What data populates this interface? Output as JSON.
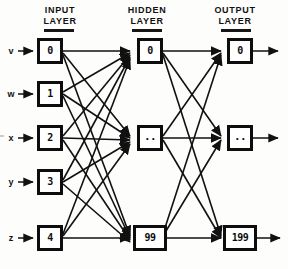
{
  "diagram": {
    "type": "neural-network",
    "columns": [
      {
        "id": "input",
        "heading_line1": "INPUT",
        "heading_line2": "LAYER"
      },
      {
        "id": "hidden",
        "heading_line1": "HIDDEN",
        "heading_line2": "LAYER"
      },
      {
        "id": "output",
        "heading_line1": "OUTPUT",
        "heading_line2": "LAYER"
      }
    ],
    "input_layer": {
      "variables": [
        "v",
        "w",
        "x",
        "y",
        "z"
      ],
      "nodes": [
        "0",
        "1",
        "2",
        "3",
        "4"
      ]
    },
    "hidden_layer": {
      "nodes": [
        "0",
        "..",
        "99"
      ]
    },
    "output_layer": {
      "nodes": [
        "0",
        "..",
        "199"
      ]
    },
    "connectivity": "fully-connected",
    "colors": {
      "ink": "#111111",
      "box_border": "#0d0d0d",
      "background": "#fdfdfc"
    }
  }
}
